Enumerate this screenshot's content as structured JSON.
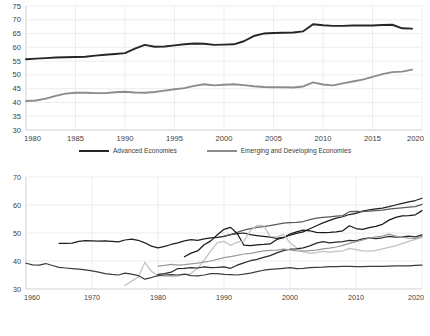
{
  "chart_data": [
    {
      "type": "line",
      "title": "",
      "xlabel": "",
      "ylabel": "",
      "xlim": [
        1980,
        2020
      ],
      "ylim": [
        30,
        75
      ],
      "yticks": [
        30,
        35,
        40,
        45,
        50,
        55,
        60,
        65,
        70,
        75
      ],
      "xticks": [
        1980,
        1985,
        1990,
        1995,
        2000,
        2005,
        2010,
        2015,
        2020
      ],
      "grid": "horizontal-and-vertical-light",
      "legend_position": "bottom-center",
      "x": [
        1980,
        1981,
        1982,
        1983,
        1984,
        1985,
        1986,
        1987,
        1988,
        1989,
        1990,
        1991,
        1992,
        1993,
        1994,
        1995,
        1996,
        1997,
        1998,
        1999,
        2000,
        2001,
        2002,
        2003,
        2004,
        2005,
        2006,
        2007,
        2008,
        2009,
        2010,
        2011,
        2012,
        2013,
        2014,
        2015,
        2016,
        2017,
        2018,
        2019
      ],
      "series": [
        {
          "name": "Advanced Economies",
          "color": "#262626",
          "values": [
            55.7,
            55.9,
            56.1,
            56.3,
            56.4,
            56.5,
            56.6,
            57.0,
            57.3,
            57.6,
            57.9,
            59.5,
            60.9,
            60.2,
            60.3,
            60.7,
            61.1,
            61.4,
            61.3,
            60.9,
            61.0,
            61.1,
            62.2,
            64.1,
            65.0,
            65.2,
            65.3,
            65.4,
            65.8,
            68.4,
            68.0,
            67.8,
            67.8,
            67.9,
            67.9,
            67.9,
            68.1,
            68.2,
            66.9,
            66.8
          ]
        },
        {
          "name": "Emerging and Developing Economies",
          "color": "#8c8c8c",
          "values": [
            40.5,
            40.7,
            41.4,
            42.4,
            43.2,
            43.5,
            43.5,
            43.4,
            43.4,
            43.7,
            43.9,
            43.6,
            43.5,
            43.8,
            44.3,
            44.8,
            45.2,
            46.0,
            46.6,
            46.2,
            46.4,
            46.6,
            46.3,
            45.9,
            45.6,
            45.5,
            45.5,
            45.4,
            45.8,
            47.3,
            46.5,
            46.2,
            46.9,
            47.6,
            48.3,
            49.3,
            50.3,
            51.0,
            51.2,
            51.9
          ]
        }
      ]
    },
    {
      "type": "line",
      "title": "",
      "xlabel": "",
      "ylabel": "",
      "xlim": [
        1960,
        2020
      ],
      "ylim": [
        30,
        70
      ],
      "yticks": [
        30,
        40,
        50,
        60,
        70
      ],
      "xticks": [
        1960,
        1970,
        1980,
        1990,
        2000,
        2010,
        2020
      ],
      "grid": "horizontal-and-vertical-light",
      "legend_position": "bottom-left-3columns",
      "series": [
        {
          "name": "East Asia & Pacific",
          "color": "#1f1f1f",
          "x": [
            1965,
            1966,
            1967,
            1968,
            1969,
            1970,
            1971,
            1972,
            1973,
            1974,
            1975,
            1976,
            1977,
            1978,
            1979,
            1980,
            1981,
            1982,
            1983,
            1984,
            1985,
            1986,
            1987,
            1988,
            1989,
            1990,
            1991,
            1992,
            1993,
            1994,
            1995,
            1996,
            1997,
            1998,
            1999,
            2000,
            2001,
            2002,
            2003,
            2004,
            2005,
            2006,
            2007,
            2008,
            2009,
            2010,
            2011,
            2012,
            2013,
            2014,
            2015,
            2016,
            2017,
            2018,
            2019,
            2020
          ],
          "values": [
            46.3,
            46.3,
            46.4,
            47.0,
            47.3,
            47.2,
            47.1,
            47.2,
            47.0,
            46.8,
            47.5,
            47.8,
            47.4,
            46.5,
            45.3,
            44.7,
            45.2,
            45.9,
            46.5,
            47.2,
            47.6,
            47.4,
            47.9,
            48.3,
            48.4,
            48.8,
            49.4,
            49.8,
            50.0,
            49.4,
            49.1,
            48.8,
            48.5,
            48.1,
            48.4,
            49.2,
            49.9,
            50.4,
            51.5,
            52.6,
            53.6,
            54.5,
            55.3,
            55.8,
            56.6,
            57.0,
            57.8,
            58.3,
            58.6,
            58.9,
            59.4,
            60.0,
            60.6,
            61.1,
            61.6,
            62.4
          ]
        },
        {
          "name": "Europe & Central Asia",
          "color": "#5a5a5a",
          "x": [
            1990,
            1991,
            1992,
            1993,
            1994,
            1995,
            1996,
            1997,
            1998,
            1999,
            2000,
            2001,
            2002,
            2003,
            2004,
            2005,
            2006,
            2007,
            2008,
            2009,
            2010,
            2011,
            2012,
            2013,
            2014,
            2015,
            2016,
            2017,
            2018,
            2019,
            2020
          ],
          "values": [
            48.9,
            49.4,
            50.2,
            51.0,
            51.6,
            52.0,
            52.3,
            52.6,
            53.1,
            53.5,
            53.7,
            53.8,
            54.1,
            54.8,
            55.3,
            55.6,
            55.8,
            56.0,
            56.2,
            57.6,
            57.7,
            57.6,
            57.8,
            58.0,
            58.2,
            58.5,
            58.8,
            59.0,
            59.2,
            59.4,
            60.2
          ]
        },
        {
          "name": "Latin America & Caribbean",
          "color": "#1a1a1a",
          "x": [
            1984,
            1985,
            1986,
            1987,
            1988,
            1989,
            1990,
            1991,
            1992,
            1993,
            1994,
            1995,
            1996,
            1997,
            1998,
            1999,
            2000,
            2001,
            2002,
            2003,
            2004,
            2005,
            2006,
            2007,
            2008,
            2009,
            2010,
            2011,
            2012,
            2013,
            2014,
            2015,
            2016,
            2017,
            2018,
            2019,
            2020
          ],
          "values": [
            41.5,
            42.8,
            43.6,
            45.8,
            47.2,
            49.4,
            51.3,
            52.0,
            49.8,
            45.7,
            45.5,
            45.8,
            45.9,
            46.1,
            47.7,
            48.3,
            49.6,
            50.4,
            51.0,
            50.8,
            50.2,
            50.1,
            50.2,
            50.4,
            50.8,
            52.6,
            51.6,
            51.3,
            51.9,
            52.4,
            53.1,
            54.6,
            55.6,
            56.1,
            56.2,
            56.5,
            58.0
          ]
        },
        {
          "name": "The Middle East & North Africa",
          "color": "#c2c2c2",
          "x": [
            1975,
            1976,
            1977,
            1978,
            1979,
            1980,
            1981,
            1982,
            1983,
            1984,
            1985,
            1986,
            1987,
            1988,
            1989,
            1990,
            1991,
            1992,
            1993,
            1994,
            1995,
            1996,
            1997,
            1998,
            1999,
            2000,
            2001,
            2002,
            2003,
            2004,
            2005,
            2006,
            2007,
            2008,
            2009,
            2010,
            2011,
            2012,
            2013,
            2014,
            2015,
            2016,
            2017,
            2018,
            2019,
            2020
          ],
          "values": [
            31.3,
            32.8,
            34.2,
            39.5,
            36.3,
            34.8,
            34.6,
            34.5,
            34.6,
            35.2,
            35.5,
            37.4,
            40.3,
            43.6,
            46.6,
            47.0,
            45.6,
            46.7,
            47.0,
            50.9,
            52.7,
            52.6,
            48.8,
            48.5,
            49.5,
            46.5,
            44.7,
            43.3,
            42.7,
            43.0,
            43.4,
            43.2,
            43.4,
            43.6,
            44.5,
            44.1,
            43.6,
            43.5,
            43.8,
            44.3,
            44.9,
            45.4,
            46.2,
            47.0,
            47.7,
            48.5
          ]
        },
        {
          "name": "South Asia",
          "color": "#2b2b2b",
          "x": [
            1980,
            1981,
            1982,
            1983,
            1984,
            1985,
            1986,
            1987,
            1988,
            1989,
            1990,
            1991,
            1992,
            1993,
            1994,
            1995,
            1996,
            1997,
            1998,
            1999,
            2000,
            2001,
            2002,
            2003,
            2004,
            2005,
            2006,
            2007,
            2008,
            2009,
            2010,
            2011,
            2012,
            2013,
            2014,
            2015,
            2016,
            2017,
            2018,
            2019,
            2020
          ],
          "values": [
            35.2,
            35.5,
            36.0,
            37.3,
            37.4,
            37.6,
            37.5,
            37.9,
            37.6,
            37.7,
            37.9,
            37.4,
            38.5,
            39.3,
            40.1,
            40.6,
            41.3,
            41.9,
            42.9,
            43.7,
            44.2,
            44.3,
            44.7,
            45.4,
            46.4,
            46.9,
            46.5,
            46.7,
            46.9,
            47.4,
            47.2,
            47.9,
            48.3,
            48.0,
            48.3,
            48.8,
            48.5,
            48.6,
            48.9,
            48.6,
            49.3
          ]
        },
        {
          "name": "Sub-Saharan Africa",
          "color": "#9a9a9a",
          "x": [
            1980,
            1981,
            1982,
            1983,
            1984,
            1985,
            1986,
            1987,
            1988,
            1989,
            1990,
            1991,
            1992,
            1993,
            1994,
            1995,
            1996,
            1997,
            1998,
            1999,
            2000,
            2001,
            2002,
            2003,
            2004,
            2005,
            2006,
            2007,
            2008,
            2009,
            2010,
            2011,
            2012,
            2013,
            2014,
            2015,
            2016,
            2017,
            2018,
            2019,
            2020
          ],
          "values": [
            38.2,
            38.4,
            38.8,
            38.5,
            38.7,
            39.0,
            39.2,
            39.6,
            40.0,
            40.6,
            41.2,
            41.6,
            42.0,
            42.5,
            42.7,
            43.2,
            43.6,
            43.8,
            43.9,
            44.2,
            44.0,
            43.6,
            43.5,
            43.7,
            43.9,
            44.3,
            44.6,
            45.0,
            45.6,
            46.3,
            46.9,
            47.5,
            48.2,
            48.6,
            48.9,
            49.6,
            48.9,
            48.5,
            48.2,
            48.1,
            48.7
          ]
        },
        {
          "name": "World",
          "color": "#3d3d3d",
          "x": [
            1960,
            1961,
            1962,
            1963,
            1964,
            1965,
            1966,
            1967,
            1968,
            1969,
            1970,
            1971,
            1972,
            1973,
            1974,
            1975,
            1976,
            1977,
            1978,
            1979,
            1980,
            1981,
            1982,
            1983,
            1984,
            1985,
            1986,
            1987,
            1988,
            1989,
            1990,
            1991,
            1992,
            1993,
            1994,
            1995,
            1996,
            1997,
            1998,
            1999,
            2000,
            2001,
            2002,
            2003,
            2004,
            2005,
            2006,
            2007,
            2008,
            2009,
            2010,
            2011,
            2012,
            2013,
            2014,
            2015,
            2016,
            2017,
            2018,
            2019,
            2020
          ],
          "values": [
            39.2,
            38.6,
            38.5,
            39.1,
            38.4,
            37.7,
            37.5,
            37.3,
            37.1,
            36.8,
            36.5,
            36.0,
            35.5,
            35.2,
            35.0,
            35.7,
            35.3,
            34.8,
            33.5,
            34.1,
            34.8,
            35.0,
            35.1,
            35.0,
            35.3,
            34.8,
            34.7,
            35.0,
            35.5,
            35.5,
            35.2,
            35.1,
            35.0,
            35.3,
            35.7,
            36.2,
            36.7,
            37.0,
            37.2,
            37.4,
            37.6,
            37.3,
            37.4,
            37.6,
            37.7,
            37.8,
            38.0,
            38.0,
            38.1,
            38.1,
            38.0,
            38.0,
            38.1,
            38.1,
            38.1,
            38.2,
            38.3,
            38.3,
            38.3,
            38.4,
            38.5
          ]
        }
      ]
    }
  ],
  "top_chart": {
    "yticks": [
      "75",
      "70",
      "65",
      "60",
      "55",
      "50",
      "45",
      "40",
      "35",
      "30"
    ],
    "xticks": [
      "1980",
      "1985",
      "1990",
      "1995",
      "2000",
      "2005",
      "2010",
      "2015",
      "2020"
    ],
    "legend": [
      {
        "label": "Advanced Economies",
        "color": "#262626"
      },
      {
        "label": "Emerging and Developing Economies",
        "color": "#8c8c8c"
      }
    ]
  },
  "bottom_chart": {
    "yticks": [
      "70",
      "60",
      "50",
      "40",
      "30"
    ],
    "xticks": [
      "1960",
      "1970",
      "1980",
      "1990",
      "2000",
      "2010",
      "2020"
    ],
    "legend_columns": [
      [
        {
          "label": "East Asia & Pacific",
          "color": "#1f1f1f"
        },
        {
          "label": "The Middle East & North Africa",
          "color": "#c2c2c2"
        },
        {
          "label": "World",
          "color": "#3d3d3d"
        }
      ],
      [
        {
          "label": "Europe & Central Asia",
          "color": "#5a5a5a"
        },
        {
          "label": "South Asia",
          "color": "#2b2b2b"
        }
      ],
      [
        {
          "label": "Latin America & Caribbean",
          "color": "#1a1a1a"
        },
        {
          "label": "Sub-Saharan Africa",
          "color": "#9a9a9a"
        }
      ]
    ]
  },
  "style": {
    "axis_color": "#d9d9d9",
    "grid_color": "#e8e8e8",
    "tick_text_color": "#404040",
    "background": "#ffffff"
  }
}
